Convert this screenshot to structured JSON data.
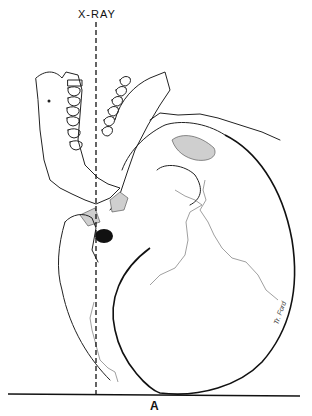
{
  "figure": {
    "reference_line_label": "X-RAY",
    "panel_label": "A",
    "signature": "Tr. Ford"
  },
  "colors": {
    "ink": "#222222",
    "background": "#ffffff",
    "shading": "#cfcfcf"
  }
}
